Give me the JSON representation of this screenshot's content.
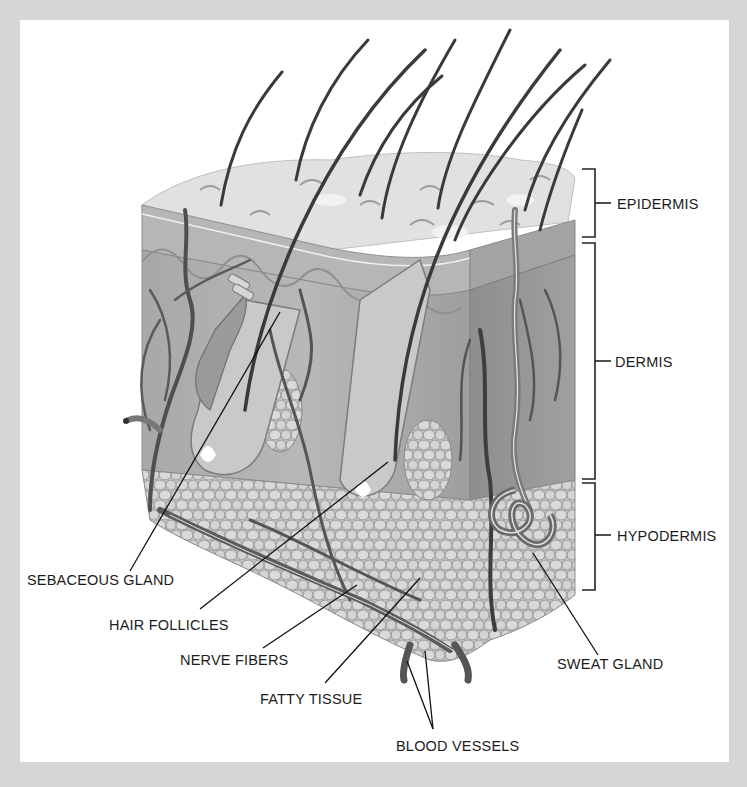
{
  "diagram": {
    "colors": {
      "frame": "#d6d6d6",
      "panel": "#ffffff",
      "epidermis_top": "#dcdcdc",
      "dermis": "#a9a9a9",
      "dermis_light": "#c4c4c4",
      "fat_cells": "#d2d2d2",
      "vessels": "#555555",
      "hair": "#3a3a3a",
      "label_text": "#1c1c1c"
    },
    "layers": [
      {
        "label": "EPIDERMIS"
      },
      {
        "label": "DERMIS"
      },
      {
        "label": "HYPODERMIS"
      }
    ],
    "callouts": [
      {
        "label": "SEBACEOUS GLAND"
      },
      {
        "label": "HAIR FOLLICLES"
      },
      {
        "label": "NERVE FIBERS"
      },
      {
        "label": "FATTY TISSUE"
      },
      {
        "label": "BLOOD VESSELS"
      },
      {
        "label": "SWEAT GLAND"
      }
    ]
  }
}
